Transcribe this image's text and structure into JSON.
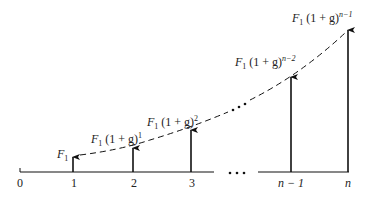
{
  "diagram": {
    "type": "cash-flow-diagram",
    "axis_labels": [
      "0",
      "1",
      "2",
      "3",
      "n − 1",
      "n"
    ],
    "ellipsis": "• • •",
    "flows": [
      {
        "period": "1",
        "base": "F",
        "sub": "1",
        "factor": "",
        "exp": ""
      },
      {
        "period": "2",
        "base": "F",
        "sub": "1",
        "factor": " (1 + g)",
        "exp": "1"
      },
      {
        "period": "3",
        "base": "F",
        "sub": "1",
        "factor": " (1 + g)",
        "exp": "2"
      },
      {
        "period": "n − 1",
        "base": "F",
        "sub": "1",
        "factor": " (1 + g)",
        "exp": "n−2"
      },
      {
        "period": "n",
        "base": "F",
        "sub": "1",
        "factor": " (1 + g)",
        "exp": "n−1"
      }
    ],
    "colors": {
      "line": "#111111",
      "text": "#222222"
    }
  }
}
